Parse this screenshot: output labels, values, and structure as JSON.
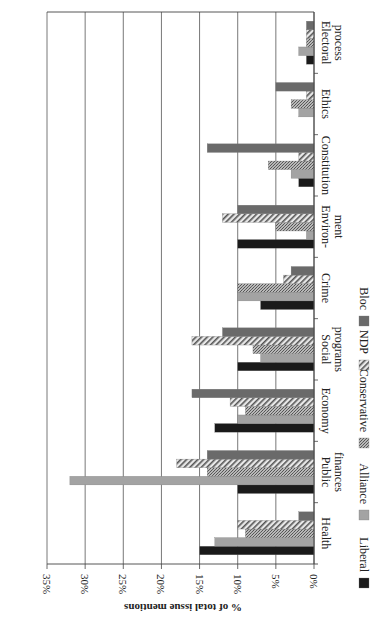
{
  "chart_data": {
    "type": "bar",
    "orientation": "horizontal-rotated",
    "title": "",
    "xlabel": "",
    "ylabel": "% of total issue mentions",
    "ylim": [
      0,
      35
    ],
    "yticks": [
      "0%",
      "5%",
      "10%",
      "15%",
      "20%",
      "25%",
      "30%",
      "35%"
    ],
    "grid": true,
    "legend_position": "bottom",
    "categories": [
      "Health",
      "Public finances",
      "Economy",
      "Social programs",
      "Crime",
      "Environ-ment",
      "Constitution",
      "Ethics",
      "Electoral process"
    ],
    "category_lines": [
      [
        "Health"
      ],
      [
        "Public",
        "finances"
      ],
      [
        "Economy"
      ],
      [
        "Social",
        "programs"
      ],
      [
        "Crime"
      ],
      [
        "Environ-",
        "ment"
      ],
      [
        "Constitution"
      ],
      [
        "Ethics"
      ],
      [
        "Electoral",
        "process"
      ]
    ],
    "series": [
      {
        "name": "Liberal",
        "pattern": "solid-black",
        "color": "#1a1a1a",
        "values": [
          15,
          10,
          13,
          10,
          7,
          10,
          2,
          0,
          1
        ]
      },
      {
        "name": "Alliance",
        "pattern": "solid-gray",
        "color": "#9a9a9a",
        "values": [
          13,
          32,
          10,
          7,
          10,
          1,
          3,
          2,
          2
        ]
      },
      {
        "name": "Conservative",
        "pattern": "stipple",
        "color": "#8c8c8c",
        "values": [
          9,
          14,
          9,
          8,
          10,
          5,
          6,
          3,
          1
        ]
      },
      {
        "name": "NDP",
        "pattern": "diagonal-hatch",
        "color": "#6e6e6e",
        "values": [
          10,
          18,
          11,
          16,
          4,
          12,
          2,
          1,
          1
        ]
      },
      {
        "name": "Bloc",
        "pattern": "solid-darkgray",
        "color": "#5e5e5e",
        "values": [
          2,
          14,
          16,
          12,
          3,
          10,
          14,
          5,
          1
        ]
      }
    ]
  }
}
